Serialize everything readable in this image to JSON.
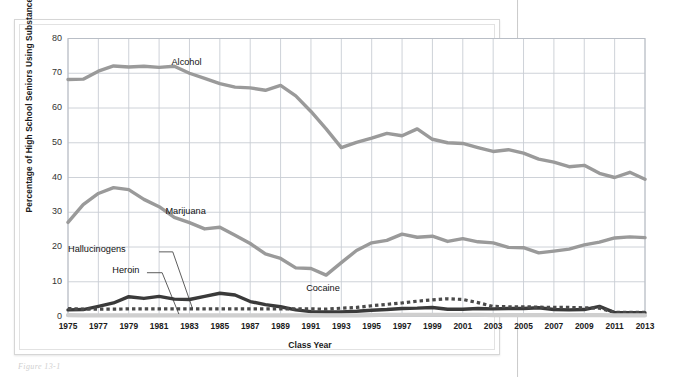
{
  "figure": {
    "caption_fragment": "Figure 13-1",
    "page_rule_present": true
  },
  "chart_data": {
    "type": "line",
    "title": "",
    "xlabel": "Class Year",
    "ylabel": "Percentage of High School Seniors Using Substance",
    "xlim": [
      1975,
      2013
    ],
    "ylim": [
      0,
      80
    ],
    "ytick_values": [
      0,
      10,
      20,
      30,
      40,
      50,
      60,
      70,
      80
    ],
    "xtick_labels": [
      "1975",
      "1977",
      "1979",
      "1981",
      "1983",
      "1985",
      "1987",
      "1989",
      "1991",
      "1993",
      "1995",
      "1997",
      "1999",
      "2001",
      "2003",
      "2005",
      "2007",
      "2009",
      "2011",
      "2013"
    ],
    "xtick_values": [
      1975,
      1977,
      1979,
      1981,
      1983,
      1985,
      1987,
      1989,
      1991,
      1993,
      1995,
      1997,
      1999,
      2001,
      2003,
      2005,
      2007,
      2009,
      2011,
      2013
    ],
    "gridlines": {
      "horizontal": true,
      "vertical": true,
      "vertical_every_years": 2,
      "color": "#c8cdd4"
    },
    "legend_position": "inline-annotations",
    "x": [
      1975,
      1976,
      1977,
      1978,
      1979,
      1980,
      1981,
      1982,
      1983,
      1984,
      1985,
      1986,
      1987,
      1988,
      1989,
      1990,
      1991,
      1992,
      1993,
      1994,
      1995,
      1996,
      1997,
      1998,
      1999,
      2000,
      2001,
      2002,
      2003,
      2004,
      2005,
      2006,
      2007,
      2008,
      2009,
      2010,
      2011,
      2012,
      2013
    ],
    "series": [
      {
        "name": "Alcohol",
        "color": "#9a9a9a",
        "style": "solid-thick",
        "label_x": 1983,
        "label_y": 73,
        "values": [
          68.2,
          68.3,
          70.6,
          72.1,
          71.8,
          72.0,
          71.7,
          72.0,
          70.0,
          68.5,
          67.0,
          66.0,
          65.8,
          65.1,
          66.5,
          63.5,
          59.0,
          54.0,
          48.6,
          50.1,
          51.3,
          52.7,
          52.0,
          54.0,
          51.0,
          50.0,
          49.8,
          48.6,
          47.5,
          48.0,
          47.0,
          45.3,
          44.4,
          43.1,
          43.5,
          41.2,
          40.0,
          41.5,
          39.5
        ]
      },
      {
        "name": "Marijuana",
        "color": "#9a9a9a",
        "style": "solid-thick",
        "label_x": 1983,
        "label_y": 30,
        "values": [
          27.1,
          32.2,
          35.4,
          37.1,
          36.5,
          33.7,
          31.6,
          28.5,
          27.0,
          25.2,
          25.7,
          23.4,
          21.0,
          18.0,
          16.7,
          14.0,
          13.8,
          11.9,
          15.5,
          19.0,
          21.2,
          21.9,
          23.7,
          22.8,
          23.1,
          21.6,
          22.4,
          21.5,
          21.2,
          19.9,
          19.8,
          18.3,
          18.8,
          19.4,
          20.6,
          21.4,
          22.6,
          22.9,
          22.7
        ]
      },
      {
        "name": "Cocaine",
        "color": "#3a3a3a",
        "style": "solid-thick",
        "label_x": 1992,
        "label_y": 8,
        "values": [
          1.9,
          2.0,
          2.9,
          3.9,
          5.7,
          5.2,
          5.8,
          5.0,
          4.9,
          5.8,
          6.7,
          6.2,
          4.3,
          3.4,
          2.8,
          1.9,
          1.4,
          1.3,
          1.3,
          1.5,
          1.8,
          2.0,
          2.3,
          2.4,
          2.6,
          2.1,
          2.1,
          2.3,
          2.2,
          2.3,
          2.3,
          2.5,
          2.0,
          1.9,
          2.0,
          2.9,
          1.1,
          1.1,
          1.1
        ]
      },
      {
        "name": "Hallucinogens",
        "color": "#4a4a4a",
        "style": "dotted-squares",
        "label_x": 1975,
        "label_y": 19,
        "values": [
          2.3,
          2.1,
          2.1,
          2.1,
          2.2,
          2.2,
          2.2,
          2.2,
          2.2,
          2.2,
          2.2,
          2.2,
          2.2,
          2.2,
          2.2,
          2.2,
          2.2,
          2.1,
          2.4,
          2.6,
          3.1,
          3.5,
          3.9,
          4.4,
          4.8,
          5.1,
          4.9,
          4.0,
          2.9,
          2.8,
          2.8,
          2.7,
          2.6,
          2.6,
          2.5,
          2.4,
          1.2,
          1.2,
          1.2
        ]
      },
      {
        "name": "Heroin",
        "color": "#cfcfcf",
        "style": "solid-thin",
        "label_x": 1977,
        "label_y": 13,
        "values": [
          0.4,
          0.3,
          0.3,
          0.3,
          0.3,
          0.3,
          0.3,
          0.3,
          0.3,
          0.3,
          0.3,
          0.3,
          0.3,
          0.3,
          0.3,
          0.3,
          0.3,
          0.3,
          0.3,
          0.3,
          0.4,
          0.5,
          0.5,
          0.5,
          0.5,
          0.5,
          0.5,
          0.5,
          0.4,
          0.4,
          0.4,
          0.4,
          0.4,
          0.4,
          0.4,
          0.4,
          0.3,
          0.3,
          0.3
        ]
      }
    ],
    "annotations": [
      {
        "name": "alcohol-label",
        "text": "Alcohol"
      },
      {
        "name": "marijuana-label",
        "text": "Marijuana"
      },
      {
        "name": "cocaine-label",
        "text": "Cocaine"
      },
      {
        "name": "hallucinogens-label",
        "text": "Hallucinogens"
      },
      {
        "name": "heroin-label",
        "text": "Heroin"
      }
    ]
  }
}
